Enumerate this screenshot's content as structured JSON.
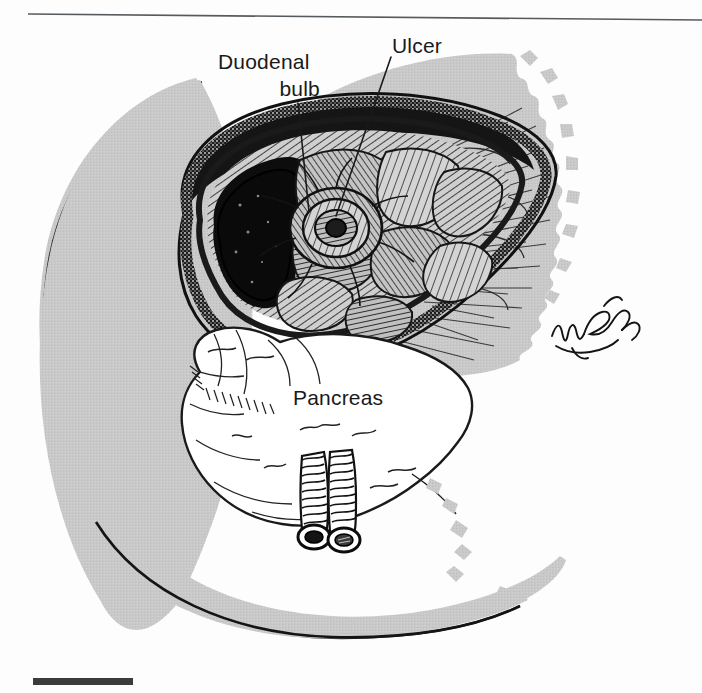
{
  "figure": {
    "kind": "medical-line-illustration",
    "width": 702,
    "height": 693
  },
  "labels": {
    "duodenal_bulb_line1": "Duodenal",
    "duodenal_bulb_line2": "bulb",
    "ulcer": "Ulcer",
    "pancreas": "Pancreas"
  },
  "annotations": {
    "signature": "artist-signature-cursive",
    "signature_reading": "Netter"
  },
  "structures": [
    {
      "name": "duodenum-cross-section",
      "label": "Duodenal bulb"
    },
    {
      "name": "ulcer-crater",
      "label": "Ulcer"
    },
    {
      "name": "pancreas-head",
      "label": "Pancreas"
    },
    {
      "name": "mesenteric-vessels",
      "label": ""
    },
    {
      "name": "stomach-silhouette",
      "label": ""
    }
  ],
  "colors": {
    "page_background": "#fdfdfd",
    "silhouette_gray": "#c9c9c9",
    "ink_black": "#1a1a1a",
    "organ_white": "#ffffff",
    "rule_gray": "#555a5e",
    "mark_dark": "#3b3b3b"
  },
  "marks": {
    "top_rule": "horizontal-rule",
    "bottom_bar": "black-bar-marker"
  }
}
